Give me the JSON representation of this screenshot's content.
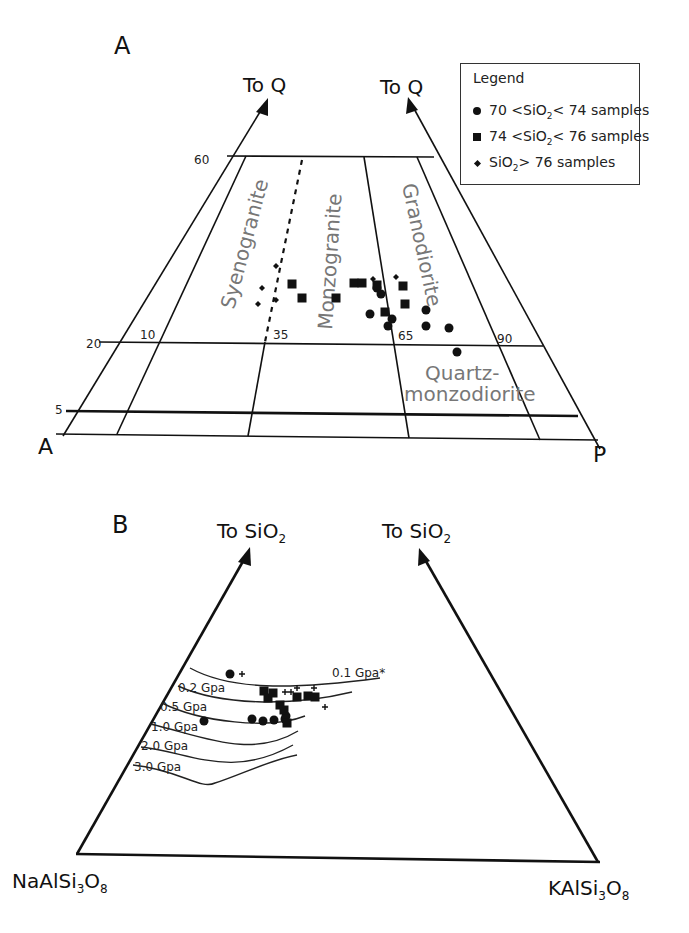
{
  "panelA": {
    "label": "A",
    "arrow_left_label": "To Q",
    "arrow_right_label": "To Q",
    "corner_left": "A",
    "corner_right": "P",
    "q_ticks": [
      "60",
      "20",
      "5"
    ],
    "ap_ticks": [
      "10",
      "35",
      "65",
      "90"
    ],
    "fields": {
      "syenogranite": "Syenogranite",
      "monzogranite": "Monzogranite",
      "granodiorite": "Granodiorite",
      "quartz_monzodiorite_1": "Quartz-",
      "quartz_monzodiorite_2": "monzodiorite"
    }
  },
  "legend": {
    "title": "Legend",
    "items": [
      {
        "symbol": "circle",
        "pre": "70 <SiO",
        "sub": "2",
        "post": "< 74  samples"
      },
      {
        "symbol": "square",
        "pre": "74 <SiO",
        "sub": "2",
        "post": "< 76  samples"
      },
      {
        "symbol": "diamond",
        "pre": "SiO",
        "sub": "2",
        "post": "> 76  samples"
      }
    ]
  },
  "panelB": {
    "label": "B",
    "arrow_left_label": "To SiO",
    "arrow_left_sub": "2",
    "arrow_right_label": "To SiO",
    "arrow_right_sub": "2",
    "corner_left": {
      "pre": "NaAlSi",
      "sub1": "3",
      "mid": "O",
      "sub2": "8"
    },
    "corner_right": {
      "pre": "KAlSi",
      "sub1": "3",
      "mid": "O",
      "sub2": "8"
    },
    "pressure_labels": [
      "0.1 Gpa*",
      "0.2 Gpa",
      "0.5 Gpa",
      "1.0 Gpa",
      "2.0 Gpa",
      "3.0 Gpa"
    ]
  },
  "chart_data": [
    {
      "type": "scatter",
      "title": "A",
      "subtitle": "QAP classification (Streckeisen) — granitoid fields",
      "axes": {
        "apex": "Q",
        "left": "A",
        "right": "P"
      },
      "q_lines": [
        60,
        20,
        5
      ],
      "ap_divisions": [
        10,
        35,
        65,
        90
      ],
      "fields": [
        "Syenogranite",
        "Monzogranite",
        "Granodiorite",
        "Quartz-monzodiorite"
      ],
      "legend_position": "top-right",
      "series": [
        {
          "name": "70 <SiO2< 74 samples",
          "marker": "circle",
          "points_px": [
            [
              377,
              288
            ],
            [
              381,
              294
            ],
            [
              370,
              314
            ],
            [
              392,
              319
            ],
            [
              388,
              326
            ],
            [
              426,
              310
            ],
            [
              426,
              326
            ],
            [
              449,
              328
            ],
            [
              457,
              352
            ]
          ]
        },
        {
          "name": "74 <SiO2< 76 samples",
          "marker": "square",
          "points_px": [
            [
              292,
              284
            ],
            [
              302,
              298
            ],
            [
              336,
              298
            ],
            [
              354,
              283
            ],
            [
              362,
              283
            ],
            [
              377,
              285
            ],
            [
              385,
              312
            ],
            [
              403,
              286
            ],
            [
              405,
              304
            ]
          ]
        },
        {
          "name": "SiO2> 76 samples",
          "marker": "diamond",
          "points_px": [
            [
              262,
              288
            ],
            [
              258,
              304
            ],
            [
              276,
              300
            ],
            [
              276,
              266
            ],
            [
              373,
              279
            ],
            [
              396,
              277
            ]
          ]
        }
      ]
    },
    {
      "type": "scatter",
      "title": "B",
      "subtitle": "Ab–Or–Qz ternary with minimum-melt curves",
      "axes": {
        "apex": "SiO2",
        "left": "NaAlSi3O8",
        "right": "KAlSi3O8"
      },
      "curves": [
        "0.1 Gpa*",
        "0.2 Gpa",
        "0.5 Gpa",
        "1.0 Gpa",
        "2.0 Gpa",
        "3.0 Gpa"
      ],
      "series": [
        {
          "name": "70 <SiO2< 74 samples",
          "marker": "circle",
          "points_px": [
            [
              230,
              674
            ],
            [
              204,
              721
            ],
            [
              252,
              719
            ],
            [
              263,
              721
            ],
            [
              274,
              720
            ],
            [
              285,
              719
            ],
            [
              286,
              716
            ]
          ]
        },
        {
          "name": "74 <SiO2< 76 samples",
          "marker": "square",
          "points_px": [
            [
              264,
              691
            ],
            [
              268,
              698
            ],
            [
              273,
              693
            ],
            [
              280,
              705
            ],
            [
              284,
              710
            ],
            [
              287,
              723
            ],
            [
              297,
              697
            ],
            [
              308,
              696
            ],
            [
              315,
              697
            ]
          ]
        },
        {
          "name": "SiO2> 76 samples",
          "marker": "cross",
          "points_px": [
            [
              242,
              674
            ],
            [
              285,
              692
            ],
            [
              291,
              692
            ],
            [
              297,
              688
            ],
            [
              314,
              688
            ],
            [
              325,
              707
            ]
          ]
        }
      ]
    }
  ]
}
